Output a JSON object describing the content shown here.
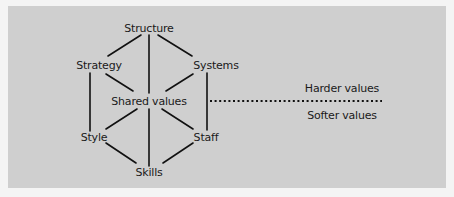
{
  "diagram": {
    "background_color": "#cfcfcf",
    "line_color": "#111111",
    "nodes": {
      "structure": "Structure",
      "strategy": "Strategy",
      "systems": "Systems",
      "shared_values": "Shared values",
      "style": "Style",
      "staff": "Staff",
      "skills": "Skills"
    },
    "divider": {
      "style": "dotted",
      "upper_label": "Harder values",
      "lower_label": "Softer values"
    },
    "edges": [
      [
        "Structure",
        "Strategy"
      ],
      [
        "Structure",
        "Systems"
      ],
      [
        "Structure",
        "Shared values"
      ],
      [
        "Strategy",
        "Shared values"
      ],
      [
        "Systems",
        "Shared values"
      ],
      [
        "Strategy",
        "Style"
      ],
      [
        "Systems",
        "Staff"
      ],
      [
        "Shared values",
        "Style"
      ],
      [
        "Shared values",
        "Staff"
      ],
      [
        "Shared values",
        "Skills"
      ],
      [
        "Style",
        "Skills"
      ],
      [
        "Staff",
        "Skills"
      ]
    ]
  }
}
